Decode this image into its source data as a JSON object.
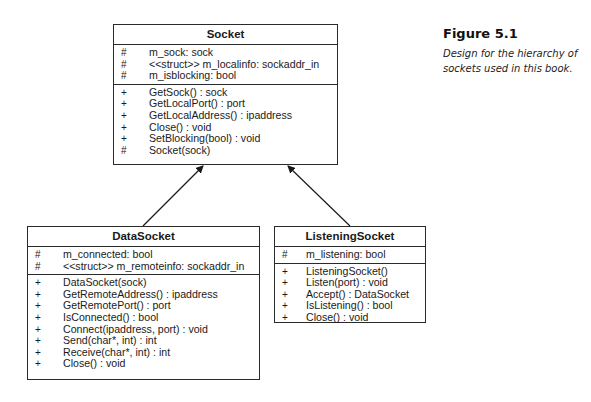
{
  "figure": {
    "label": "Figure 5.1",
    "caption_line1": "Design for the hierarchy of",
    "caption_line2": "sockets used in this book."
  },
  "classes": {
    "socket": {
      "name": "Socket",
      "attributes": [
        {
          "vis": "#",
          "text": "m_sock: sock"
        },
        {
          "vis": "#",
          "text": "<<struct>> m_localinfo: sockaddr_in"
        },
        {
          "vis": "#",
          "text": "m_isblocking: bool"
        }
      ],
      "methods": [
        {
          "vis": "+",
          "text": "GetSock() : sock"
        },
        {
          "vis": "+",
          "text": "GetLocalPort() : port"
        },
        {
          "vis": "+",
          "text": "GetLocalAddress() : ipaddress"
        },
        {
          "vis": "+",
          "text": "Close() : void"
        },
        {
          "vis": "+",
          "text": "SetBlocking(bool) : void"
        },
        {
          "vis": "#",
          "text": "Socket(sock)"
        }
      ]
    },
    "datasocket": {
      "name": "DataSocket",
      "attributes": [
        {
          "vis": "#",
          "text": "m_connected: bool"
        },
        {
          "vis": "#",
          "text": "<<struct>> m_remoteinfo: sockaddr_in"
        }
      ],
      "methods": [
        {
          "vis": "+",
          "text": "DataSocket(sock)"
        },
        {
          "vis": "+",
          "text": "GetRemoteAddress() : ipaddress"
        },
        {
          "vis": "+",
          "text": "GetRemotePort() : port"
        },
        {
          "vis": "+",
          "text": "IsConnected() : bool"
        },
        {
          "vis": "+",
          "text": "Connect(ipaddress, port) : void"
        },
        {
          "vis": "+",
          "text": "Send(char*, int) : int"
        },
        {
          "vis": "+",
          "text": "Receive(char*, int) : int"
        },
        {
          "vis": "+",
          "text": "Close() : void"
        }
      ]
    },
    "listeningsocket": {
      "name": "ListeningSocket",
      "attributes": [
        {
          "vis": "#",
          "text": "m_listening: bool"
        }
      ],
      "methods": [
        {
          "vis": "+",
          "text": "ListeningSocket()"
        },
        {
          "vis": "+",
          "text": "Listen(port) : void"
        },
        {
          "vis": "+",
          "text": "Accept() : DataSocket"
        },
        {
          "vis": "+",
          "text": "IsListening() : bool"
        },
        {
          "vis": "+",
          "text": "Close() : void"
        }
      ]
    }
  },
  "relationships": [
    {
      "from": "DataSocket",
      "to": "Socket",
      "type": "inheritance"
    },
    {
      "from": "ListeningSocket",
      "to": "Socket",
      "type": "inheritance"
    }
  ]
}
